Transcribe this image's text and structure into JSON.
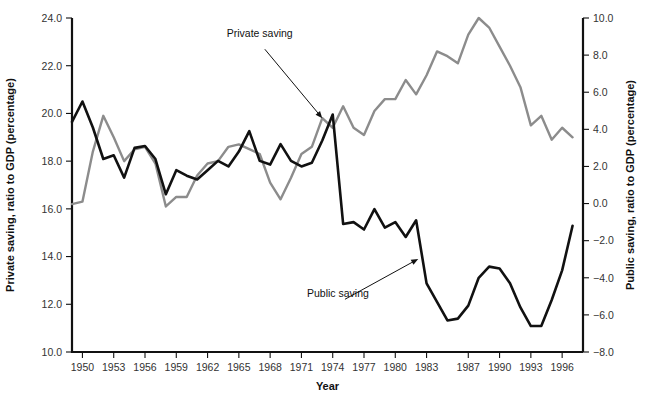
{
  "chart_data": {
    "type": "line",
    "title": "",
    "xlabel": "Year",
    "ylabel": "Private saving, ratio to GDP (percentage)",
    "y2label": "Public saving, ratio to GDP (percentage)",
    "grid": false,
    "legend": "annotations-inline",
    "xlim": [
      1949,
      1998
    ],
    "ylim": [
      10.0,
      24.0
    ],
    "y2lim": [
      -8.0,
      10.0
    ],
    "xticks": [
      1950,
      1953,
      1956,
      1959,
      1962,
      1965,
      1968,
      1971,
      1974,
      1977,
      1980,
      1983,
      1987,
      1990,
      1993,
      1996
    ],
    "xticklabels": [
      "1950",
      "1953",
      "1956",
      "1959",
      "1962",
      "1965",
      "1968",
      "1971",
      "1974",
      "1977",
      "1980",
      "1983",
      "1987",
      "1990",
      "1993",
      "1996"
    ],
    "yticks": [
      10.0,
      12.0,
      14.0,
      16.0,
      18.0,
      20.0,
      22.0,
      24.0
    ],
    "yticklabels": [
      "10.0",
      "12.0",
      "14.0",
      "16.0",
      "18.0",
      "20.0",
      "22.0",
      "24.0"
    ],
    "y2ticks": [
      -8.0,
      -6.0,
      -4.0,
      -2.0,
      0.0,
      2.0,
      4.0,
      6.0,
      8.0,
      10.0
    ],
    "y2ticklabels": [
      "−8.0",
      "−6.0",
      "−4.0",
      "−2.0",
      "0.0",
      "2.0",
      "4.0",
      "6.0",
      "8.0",
      "10.0"
    ],
    "x": [
      1949,
      1950,
      1951,
      1952,
      1953,
      1954,
      1955,
      1956,
      1957,
      1958,
      1959,
      1960,
      1961,
      1962,
      1963,
      1964,
      1965,
      1966,
      1967,
      1968,
      1969,
      1970,
      1971,
      1972,
      1973,
      1974,
      1975,
      1976,
      1977,
      1978,
      1979,
      1980,
      1981,
      1982,
      1983,
      1984,
      1985,
      1986,
      1987,
      1988,
      1989,
      1990,
      1991,
      1992,
      1993,
      1994,
      1995,
      1996,
      1997
    ],
    "series": [
      {
        "name": "Private saving",
        "axis": "left",
        "color": "#8c8c8c",
        "units": "percent of GDP",
        "values": [
          16.2,
          16.3,
          18.4,
          19.9,
          19.0,
          18.0,
          18.5,
          18.6,
          17.9,
          16.1,
          16.5,
          16.5,
          17.4,
          17.9,
          18.0,
          18.6,
          18.7,
          18.5,
          18.3,
          17.1,
          16.4,
          17.3,
          18.3,
          18.6,
          19.8,
          19.4,
          20.3,
          19.4,
          19.1,
          20.1,
          20.6,
          20.6,
          21.4,
          20.8,
          21.6,
          22.6,
          22.4,
          22.1,
          23.3,
          24.0,
          23.6,
          22.8,
          22.0,
          21.1,
          19.5,
          19.9,
          18.9,
          19.4,
          19.0
        ],
        "chart_values_right_axis_equivalent": null
      },
      {
        "name": "Public saving",
        "axis": "right",
        "color": "#111111",
        "units": "percent of GDP",
        "values": [
          4.4,
          5.5,
          4.1,
          2.4,
          2.6,
          1.4,
          3.0,
          3.1,
          2.4,
          0.5,
          1.8,
          1.5,
          1.3,
          1.8,
          2.3,
          2.0,
          2.8,
          3.9,
          2.3,
          2.1,
          3.2,
          2.3,
          2.0,
          2.2,
          3.4,
          4.8,
          -1.1,
          -1.0,
          -1.4,
          -0.3,
          -1.3,
          -1.0,
          -1.8,
          -0.9,
          -4.3,
          -5.3,
          -6.3,
          -6.2,
          -5.5,
          -4.0,
          -3.4,
          -3.5,
          -4.3,
          -5.6,
          -6.6,
          -6.6,
          -5.2,
          -3.6,
          -1.2
        ]
      }
    ],
    "annotations": [
      {
        "label": "Private saving",
        "text_x": 1967.0,
        "text_y_left": 23.2,
        "target_x": 1973.0,
        "target_y_left": 19.8
      },
      {
        "label": "Public saving",
        "text_x": 1974.5,
        "text_y_left": 12.3,
        "target_x": 1982.2,
        "target_y_left": 13.9
      }
    ]
  },
  "axes": {
    "left_title": "Private saving, ratio to GDP (percentage)",
    "right_title": "Public saving, ratio to GDP (percentage)",
    "bottom_title": "Year"
  },
  "colors": {
    "private_line": "#8c8c8c",
    "public_line": "#111111",
    "axis": "#111111",
    "background": "#ffffff"
  }
}
